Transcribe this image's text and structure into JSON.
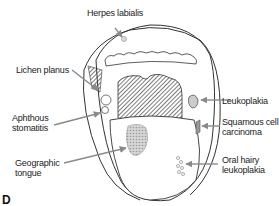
{
  "figure": {
    "panel_letter": "D",
    "labels": {
      "herpes_labialis": "Herpes labialis",
      "lichen_planus": "Lichen planus",
      "aphthous_stomatitis_line1": "Aphthous",
      "aphthous_stomatitis_line2": "stomatitis",
      "geographic_tongue_line1": "Geographic",
      "geographic_tongue_line2": "tongue",
      "leukoplakia": "Leukoplakia",
      "squamous_cell_carcinoma_line1": "Squamous cell",
      "squamous_cell_carcinoma_line2": "carcinoma",
      "oral_hairy_leukoplakia_line1": "Oral hairy",
      "oral_hairy_leukoplakia_line2": "leukoplakia"
    },
    "colors": {
      "line": "#333333",
      "arrow": "#8a8a8a",
      "hatch": "#444444",
      "lesion": "#bbbbbb"
    }
  }
}
